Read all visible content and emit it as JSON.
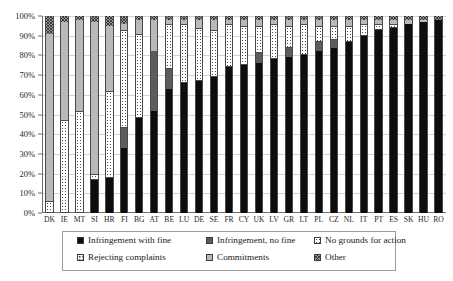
{
  "chart_data": {
    "type": "bar",
    "title": "",
    "xlabel": "",
    "ylabel": "",
    "ylim": [
      0,
      100
    ],
    "grid": true,
    "stacked": true,
    "stack_mode": "percent",
    "legend_position": "bottom",
    "ytick_labels": [
      "100%",
      "90%",
      "80%",
      "70%",
      "60%",
      "50%",
      "40%",
      "30%",
      "20%",
      "10%",
      "0%"
    ],
    "ytick_values": [
      100,
      90,
      80,
      70,
      60,
      50,
      40,
      30,
      20,
      10,
      0
    ],
    "categories": [
      "DK",
      "IE",
      "MT",
      "SI",
      "HR",
      "FI",
      "BG",
      "AT",
      "BE",
      "LU",
      "DE",
      "SE",
      "FR",
      "CY",
      "UK",
      "LV",
      "GR",
      "LT",
      "PL",
      "CZ",
      "NL",
      "IT",
      "PT",
      "ES",
      "SK",
      "HU",
      "RO"
    ],
    "series": [
      {
        "name": "Infringement with fine",
        "color": "#0d0d0d",
        "values": [
          0,
          0,
          0,
          17,
          18,
          33,
          48,
          52,
          63,
          66,
          67,
          69,
          74,
          75,
          76,
          78,
          79,
          80,
          82,
          84,
          87,
          90,
          93,
          94,
          96,
          97,
          98
        ]
      },
      {
        "name": "Infringement, no fine",
        "color": "#5c5c5c",
        "values": [
          0,
          0,
          0,
          0,
          0,
          10,
          0,
          30,
          10,
          0,
          0,
          0,
          0,
          0,
          5,
          0,
          5,
          0,
          5,
          4,
          0,
          0,
          0,
          0,
          0,
          0,
          0
        ]
      },
      {
        "name": "No grounds for action",
        "color": "#ffffff",
        "values": [
          6,
          47,
          52,
          3,
          44,
          50,
          43,
          0,
          23,
          30,
          27,
          24,
          22,
          20,
          14,
          18,
          11,
          16,
          8,
          7,
          8,
          6,
          3,
          2,
          0,
          0,
          0
        ]
      },
      {
        "name": "Rejecting complaints",
        "color": "#ffffff",
        "values": [
          0,
          0,
          0,
          0,
          0,
          0,
          0,
          0,
          0,
          0,
          0,
          0,
          0,
          0,
          0,
          0,
          0,
          0,
          0,
          0,
          0,
          0,
          0,
          0,
          0,
          0,
          0
        ]
      },
      {
        "name": "Commitments",
        "color": "#b9b9b9",
        "values": [
          85,
          50,
          46,
          77,
          33,
          3,
          7,
          16,
          2,
          2,
          4,
          5,
          2,
          3,
          3,
          2,
          3,
          2,
          3,
          3,
          3,
          2,
          2,
          2,
          2,
          1,
          0
        ]
      },
      {
        "name": "Other",
        "color": "#9a9a9a",
        "values": [
          9,
          3,
          2,
          3,
          5,
          4,
          2,
          2,
          2,
          2,
          2,
          2,
          2,
          2,
          2,
          2,
          2,
          2,
          2,
          2,
          2,
          2,
          2,
          2,
          2,
          2,
          2
        ]
      }
    ],
    "legend_entries": [
      "Infringement with fine",
      "Infringement, no fine",
      "No grounds for action",
      "Rejecting complaints",
      "Commitments",
      "Other"
    ]
  }
}
